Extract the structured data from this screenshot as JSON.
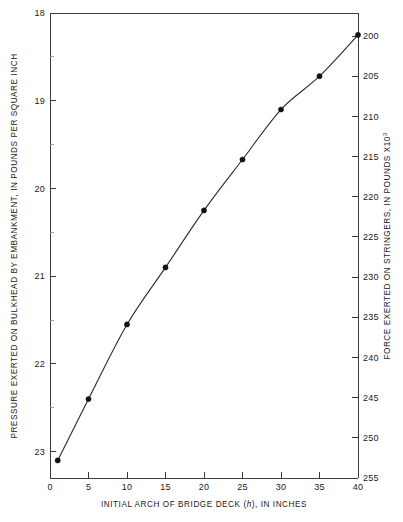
{
  "chart_data": {
    "type": "line",
    "title": "",
    "subtitle": "",
    "xlabel": "INITIAL ARCH OF BRIDGE DECK (h), IN INCHES",
    "xlabel_parts": {
      "before": "INITIAL ARCH OF BRIDGE DECK (",
      "italic": "h",
      "after": "), IN INCHES"
    },
    "ylabel": "PRESSURE EXERTED ON BULKHEAD BY EMBANKMENT, IN POUNDS PER SQUARE INCH",
    "y2label": "FORCE EXERTED ON STRINGERS, IN POUNDS X10",
    "y2label_superscript": "3",
    "xlim": [
      0,
      40
    ],
    "ylim": [
      18,
      23.3
    ],
    "y2lim": [
      200,
      255
    ],
    "y_inverted": true,
    "y2_inverted": true,
    "grid": false,
    "legend": "none",
    "xticks": [
      0,
      5,
      10,
      15,
      20,
      25,
      30,
      35,
      40
    ],
    "xtick_labels": [
      "0",
      "5",
      "10",
      "15",
      "20",
      "25",
      "30",
      "35",
      "40"
    ],
    "yticks": [
      18,
      19,
      20,
      21,
      22,
      23
    ],
    "ytick_labels": [
      "18",
      "19",
      "20",
      "21",
      "22",
      "23"
    ],
    "yticks_minor": [
      18.5,
      19.5,
      20.5,
      21.5,
      22.5
    ],
    "y2ticks": [
      200,
      205,
      210,
      215,
      220,
      225,
      230,
      235,
      240,
      245,
      250,
      255
    ],
    "y2tick_labels": [
      "200",
      "205",
      "210",
      "215",
      "220",
      "225",
      "230",
      "235",
      "240",
      "245",
      "250",
      "255"
    ],
    "x": [
      1,
      5,
      10,
      15,
      20,
      25,
      30,
      35,
      40
    ],
    "y": [
      23.1,
      22.4,
      21.55,
      20.9,
      20.25,
      19.67,
      19.1,
      18.72,
      18.25
    ],
    "y2": [
      254.0,
      246.0,
      236.5,
      230.0,
      223.0,
      216.5,
      210.0,
      205.0,
      200.0
    ],
    "series": [
      {
        "name": "pressure-vs-arch",
        "marker": "filled-circle",
        "line_style": "solid",
        "color": "#2b2b2b",
        "points": [
          {
            "x": 1,
            "y": 23.1,
            "y2": 254.0
          },
          {
            "x": 5,
            "y": 22.4,
            "y2": 246.0
          },
          {
            "x": 10,
            "y": 21.55,
            "y2": 236.5
          },
          {
            "x": 15,
            "y": 20.9,
            "y2": 230.0
          },
          {
            "x": 20,
            "y": 20.25,
            "y2": 223.0
          },
          {
            "x": 25,
            "y": 19.67,
            "y2": 216.5
          },
          {
            "x": 30,
            "y": 19.1,
            "y2": 210.0
          },
          {
            "x": 35,
            "y": 18.72,
            "y2": 205.0
          },
          {
            "x": 40,
            "y": 18.25,
            "y2": 200.0
          }
        ]
      }
    ]
  },
  "colors": {
    "background": "#ffffff",
    "axis": "#3c3c3c",
    "minor_tick": "#8a8a8a",
    "curve": "#2b2b2b",
    "marker": "#111111",
    "text": "#1a1a1a"
  }
}
